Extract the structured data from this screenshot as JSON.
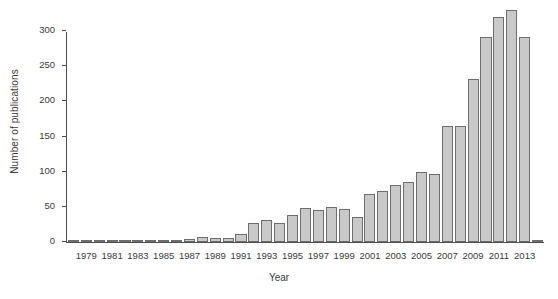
{
  "chart_data": {
    "type": "bar",
    "title": "",
    "xlabel": "Year",
    "ylabel": "Number of publications",
    "ylim": [
      0,
      330
    ],
    "yticks": [
      0,
      50,
      100,
      150,
      200,
      250,
      300
    ],
    "ytick_labels": [
      "0",
      "50",
      "100",
      "150",
      "200",
      "250",
      "300"
    ],
    "grid": false,
    "legend": null,
    "xtick_labels": [
      "1979",
      "1981",
      "1983",
      "1985",
      "1987",
      "1989",
      "1991",
      "1993",
      "1995",
      "1997",
      "1999",
      "2001",
      "2003",
      "2005",
      "2007",
      "2009",
      "2011",
      "2013"
    ],
    "bar_color": "#c9c9c9",
    "bar_edge_color": "#6e6e6e",
    "axis_color": "#4d4d4d",
    "categories": [
      "1978",
      "1979",
      "1980",
      "1981",
      "1982",
      "1983",
      "1984",
      "1985",
      "1986",
      "1987",
      "1988",
      "1989",
      "1990",
      "1991",
      "1992",
      "1993",
      "1994",
      "1995",
      "1996",
      "1997",
      "1998",
      "1999",
      "2000",
      "2001",
      "2002",
      "2003",
      "2004",
      "2005",
      "2006",
      "2007",
      "2008",
      "2009",
      "2010",
      "2011",
      "2012",
      "2013",
      "2014"
    ],
    "values": [
      1,
      1,
      1,
      1,
      2,
      2,
      1,
      1,
      3,
      4,
      7,
      6,
      6,
      11,
      27,
      31,
      27,
      38,
      49,
      46,
      50,
      47,
      35,
      68,
      73,
      81,
      85,
      100,
      97,
      165,
      165,
      232,
      292,
      320,
      330,
      292,
      1
    ]
  },
  "axis": {
    "ylabel": "Number of publications",
    "xlabel": "Year"
  }
}
